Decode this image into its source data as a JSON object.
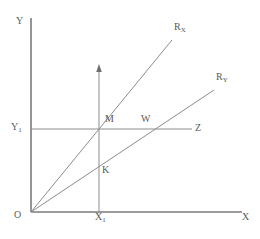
{
  "figure": {
    "background_color": "#ffffff",
    "line_color": "#8c8c8c",
    "axis_color": "#7a7a7a",
    "text_color": "#5a5a5a"
  },
  "axes": {
    "vertical": {
      "name": "Y",
      "label": "Y",
      "x": 31,
      "y_top": 18,
      "y_bottom": 212
    },
    "horizontal": {
      "name": "X",
      "label": "X",
      "y": 212,
      "x_left": 31,
      "x_right": 242
    },
    "origin": {
      "label": "O",
      "x": 31,
      "y": 212
    }
  },
  "ticks": {
    "y1": {
      "base": "Y",
      "sub": "1",
      "value_y": 129
    },
    "x1": {
      "base": "X",
      "sub": "1",
      "value_x": 99
    }
  },
  "rays": [
    {
      "id": "ray-rx",
      "base": "R",
      "sub": "X",
      "from": [
        31,
        212
      ],
      "to": [
        172,
        40
      ],
      "slope_desc": "steeper ray from origin"
    },
    {
      "id": "ray-ry",
      "base": "R",
      "sub": "Y",
      "from": [
        31,
        212
      ],
      "to": [
        214,
        90
      ],
      "slope_desc": "shallower ray from origin"
    }
  ],
  "guides": {
    "horizontal_z": {
      "label": "Z",
      "from": [
        31,
        129
      ],
      "to": [
        192,
        129
      ]
    },
    "vertical_arrow": {
      "from": [
        99,
        212
      ],
      "to": [
        99,
        66
      ],
      "arrowhead": "up"
    }
  },
  "points": [
    {
      "label": "M",
      "x": 99,
      "y": 129,
      "desc": "intersection of R_X with horizontal line Y1"
    },
    {
      "label": "W",
      "x": 142,
      "y": 129,
      "desc": "intersection of R_Y with horizontal line Y1"
    },
    {
      "label": "K",
      "x": 99,
      "y": 176,
      "desc": "intersection of R_Y with vertical line X1"
    }
  ]
}
